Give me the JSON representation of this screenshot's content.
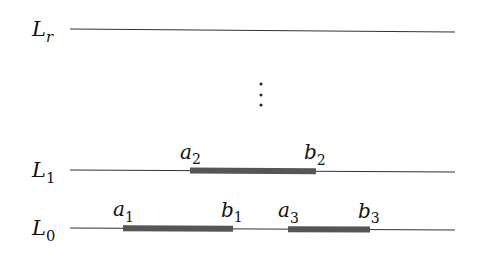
{
  "diagram": {
    "levels": [
      {
        "name": "L",
        "sub": "r",
        "y_left": 29,
        "y_right": 32,
        "label_x": 32,
        "segments": []
      },
      {
        "name": "L",
        "sub": "1",
        "y_left": 170,
        "y_right": 172,
        "label_x": 32,
        "segments": [
          {
            "start_label": "a",
            "start_sub": "2",
            "end_label": "b",
            "end_sub": "2",
            "x1": 190,
            "x2": 316
          }
        ]
      },
      {
        "name": "L",
        "sub": "0",
        "y_left": 228,
        "y_right": 230,
        "label_x": 32,
        "segments": [
          {
            "start_label": "a",
            "start_sub": "1",
            "end_label": "b",
            "end_sub": "1",
            "x1": 123,
            "x2": 233
          },
          {
            "start_label": "a",
            "start_sub": "3",
            "end_label": "b",
            "end_sub": "3",
            "x1": 288,
            "x2": 370
          }
        ]
      }
    ],
    "ellipsis": "⋮",
    "line_x_start": 70,
    "line_x_end": 455,
    "colors": {
      "line": "#333333",
      "segment": "#555555",
      "text": "#111111"
    }
  }
}
